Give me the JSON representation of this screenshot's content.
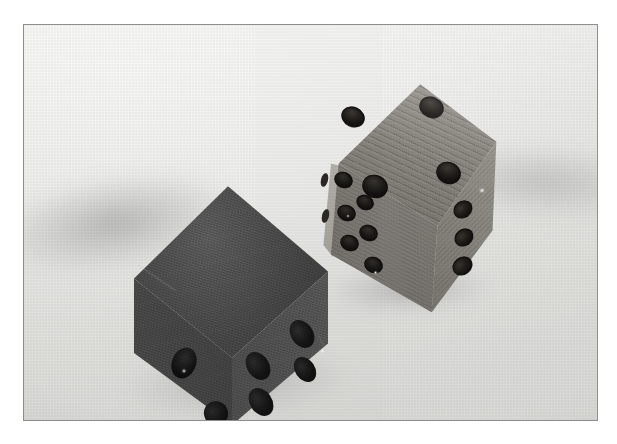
{
  "image": {
    "kind": "photograph",
    "subject": "Two wooden dice resting on a light gray surface",
    "color_mode": "grayscale",
    "width": 617,
    "height": 444,
    "frame": {
      "border_color": "#8d8d8d",
      "border_width_px": 1,
      "left": 23,
      "top": 24,
      "width": 575,
      "height": 397
    },
    "background": {
      "surface_color": "#eeeeec",
      "surface_color_dark": "#dededb",
      "highlight_color": "#f4f4f2",
      "shadow_color": "#6e6e6e"
    }
  },
  "objects": [
    {
      "name": "dark-die",
      "label": "Dark charcoal die",
      "material": "painted wood",
      "tone": "dark charcoal gray",
      "body_color": "#4a4a4a",
      "pip_color": "#1f1f1f",
      "orientation": "corner toward viewer, resting flat",
      "position": {
        "left": 104,
        "top": 160,
        "width": 200,
        "height": 240
      },
      "visible_faces": [
        {
          "name": "top",
          "pip_count": 0,
          "note": "dark, pips not discernible"
        },
        {
          "name": "left",
          "pip_count": 1,
          "note": "single pip with specular highlight"
        },
        {
          "name": "right",
          "pip_count": 4,
          "note": "pips at the corners"
        }
      ]
    },
    {
      "name": "wooden-die",
      "label": "Light wooden die",
      "material": "bare wood with horizontal grain",
      "tone": "medium warm gray",
      "body_color": "#8b8881",
      "pip_color": "#262320",
      "orientation": "tilted, leaning back and to the right",
      "position": {
        "left": 288,
        "top": 52,
        "width": 190,
        "height": 240
      },
      "visible_faces": [
        {
          "name": "top",
          "pip_count": 4,
          "note": "four corner pips, strong grain lines"
        },
        {
          "name": "front-left",
          "pip_count": 6,
          "note": "two columns of three pips"
        },
        {
          "name": "right",
          "pip_count": 3,
          "note": "partially visible column of pips"
        },
        {
          "name": "far-left-sliver",
          "pip_count": 2,
          "note": "narrow edge sliver, pips clipped"
        }
      ]
    }
  ],
  "shadows": [
    {
      "name": "dark-die-left-shadow",
      "direction": "left",
      "softness": "soft"
    },
    {
      "name": "dark-die-contact-shadow",
      "direction": "below",
      "softness": "soft"
    },
    {
      "name": "wooden-die-right-shadow",
      "direction": "right",
      "softness": "soft"
    },
    {
      "name": "wooden-die-contact-shadow",
      "direction": "below",
      "softness": "medium"
    }
  ],
  "chart_data": null
}
